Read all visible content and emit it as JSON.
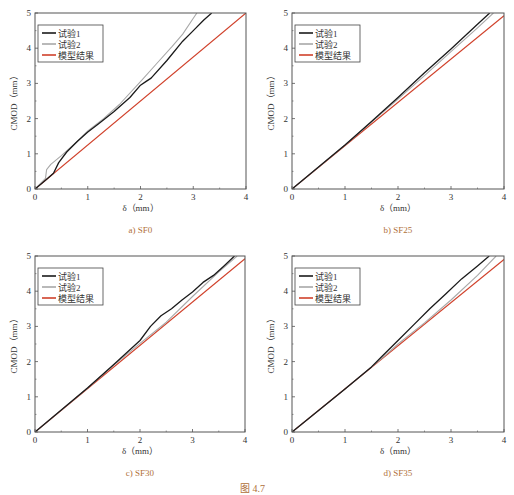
{
  "figure_caption": "图 4.7",
  "colors": {
    "test1": "#1a1a1a",
    "test2": "#a8a8a8",
    "model": "#d0402a",
    "caption": "#b0703a",
    "axis": "#555555"
  },
  "chart_data": [
    {
      "type": "line",
      "panel": "a",
      "caption": "a) SF0",
      "xlabel": "δ（mm）",
      "ylabel": "CMOD（mm）",
      "xlim": [
        0,
        4
      ],
      "ylim": [
        0,
        5
      ],
      "xticks": [
        "0",
        "1",
        "2",
        "3",
        "4"
      ],
      "yticks": [
        "0",
        "1",
        "2",
        "3",
        "4",
        "5"
      ],
      "legend": [
        "试验1",
        "试验2",
        "模型结果"
      ],
      "legend_position": "upper left",
      "series": [
        {
          "name": "试验1",
          "x": [
            0,
            0.2,
            0.35,
            0.45,
            0.6,
            0.8,
            1.0,
            1.2,
            1.5,
            1.8,
            2.0,
            2.1,
            2.2,
            2.5,
            2.8,
            3.0,
            3.2,
            3.35
          ],
          "y": [
            0,
            0.25,
            0.45,
            0.75,
            1.05,
            1.35,
            1.62,
            1.85,
            2.2,
            2.6,
            2.95,
            3.05,
            3.15,
            3.65,
            4.2,
            4.5,
            4.8,
            5.0
          ]
        },
        {
          "name": "试验2",
          "x": [
            0,
            0.2,
            0.22,
            0.3,
            0.5,
            0.8,
            1.0,
            1.3,
            1.6,
            2.0,
            2.3,
            2.6,
            2.8,
            3.0,
            3.07
          ],
          "y": [
            0,
            0.3,
            0.55,
            0.7,
            0.95,
            1.35,
            1.65,
            2.0,
            2.4,
            3.05,
            3.55,
            4.05,
            4.4,
            4.85,
            5.0
          ]
        },
        {
          "name": "模型结果",
          "x": [
            0,
            4
          ],
          "y": [
            0,
            5.0
          ]
        }
      ]
    },
    {
      "type": "line",
      "panel": "b",
      "caption": "b) SF25",
      "xlabel": "δ（mm）",
      "ylabel": "CMOD（mm）",
      "xlim": [
        0,
        4
      ],
      "ylim": [
        0,
        5
      ],
      "xticks": [
        "0",
        "1",
        "2",
        "3",
        "4"
      ],
      "yticks": [
        "0",
        "1",
        "2",
        "3",
        "4",
        "5"
      ],
      "legend": [
        "试验1",
        "试验2",
        "模型结果"
      ],
      "legend_position": "upper left",
      "series": [
        {
          "name": "试验1",
          "x": [
            0,
            1.0,
            1.5,
            2.0,
            2.5,
            3.0,
            3.5,
            3.73
          ],
          "y": [
            0,
            1.25,
            1.92,
            2.6,
            3.3,
            3.98,
            4.68,
            5.0
          ]
        },
        {
          "name": "试验2",
          "x": [
            0,
            1.0,
            1.5,
            2.0,
            2.5,
            3.0,
            3.5,
            3.8
          ],
          "y": [
            0,
            1.25,
            1.9,
            2.55,
            3.22,
            3.9,
            4.58,
            5.0
          ]
        },
        {
          "name": "模型结果",
          "x": [
            0,
            4
          ],
          "y": [
            0,
            4.92
          ]
        }
      ]
    },
    {
      "type": "line",
      "panel": "c",
      "caption": "c) SF30",
      "xlabel": "δ（mm）",
      "ylabel": "CMOD（mm）",
      "xlim": [
        0,
        4
      ],
      "ylim": [
        0,
        5
      ],
      "xticks": [
        "0",
        "1",
        "2",
        "3",
        "4"
      ],
      "yticks": [
        "0",
        "1",
        "2",
        "3",
        "4",
        "5"
      ],
      "legend": [
        "试验1",
        "试验2",
        "模型结果"
      ],
      "legend_position": "upper left",
      "series": [
        {
          "name": "试验1",
          "x": [
            0,
            1.0,
            1.5,
            2.0,
            2.2,
            2.4,
            2.6,
            2.8,
            3.0,
            3.2,
            3.4,
            3.6,
            3.8
          ],
          "y": [
            0,
            1.25,
            1.92,
            2.6,
            3.0,
            3.3,
            3.5,
            3.75,
            3.98,
            4.25,
            4.45,
            4.72,
            5.0
          ]
        },
        {
          "name": "试验2",
          "x": [
            0,
            1.0,
            1.5,
            2.0,
            2.5,
            3.0,
            3.5,
            3.85
          ],
          "y": [
            0,
            1.25,
            1.9,
            2.52,
            3.12,
            3.85,
            4.55,
            5.0
          ]
        },
        {
          "name": "模型结果",
          "x": [
            0,
            4
          ],
          "y": [
            0,
            4.92
          ]
        }
      ]
    },
    {
      "type": "line",
      "panel": "d",
      "caption": "d) SF35",
      "xlabel": "δ（mm）",
      "ylabel": "CMOD（mm）",
      "xlim": [
        0,
        4
      ],
      "ylim": [
        0,
        5
      ],
      "xticks": [
        "0",
        "1",
        "2",
        "3",
        "4"
      ],
      "yticks": [
        "0",
        "1",
        "2",
        "3",
        "4",
        "5"
      ],
      "legend": [
        "试验1",
        "试验2",
        "模型结果"
      ],
      "legend_position": "upper left",
      "series": [
        {
          "name": "试验1",
          "x": [
            0,
            1.0,
            1.5,
            1.7,
            2.0,
            2.3,
            2.6,
            2.9,
            3.2,
            3.5,
            3.72
          ],
          "y": [
            0,
            1.22,
            1.85,
            2.15,
            2.6,
            3.05,
            3.5,
            3.92,
            4.35,
            4.72,
            5.0
          ]
        },
        {
          "name": "试验2",
          "x": [
            0,
            1.0,
            1.5,
            1.7,
            2.0,
            2.5,
            3.0,
            3.5,
            3.85
          ],
          "y": [
            0,
            1.22,
            1.85,
            2.1,
            2.5,
            3.1,
            3.75,
            4.45,
            5.0
          ]
        },
        {
          "name": "模型结果",
          "x": [
            0,
            4
          ],
          "y": [
            0,
            4.9
          ]
        }
      ]
    }
  ]
}
